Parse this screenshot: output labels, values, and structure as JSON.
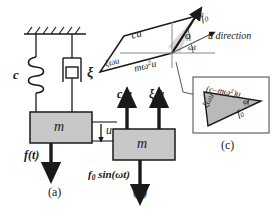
{
  "figure": {
    "background": "#ffffff",
    "ink_color": "#1a1a1a",
    "mass_fill": "#c8c8c8",
    "shade_fill": "#b5b5b5",
    "light_shade_fill": "#d9d9d9",
    "width": 273,
    "height": 217
  },
  "panel_a": {
    "tag": "(a)",
    "spring_label": "c",
    "damper_label": "ξ",
    "mass_label": "m",
    "displacement_label": "u",
    "force_label": "f(t)"
  },
  "panel_b": {
    "tag": "(b)",
    "mass_label": "m",
    "spring_force_label_main": "c",
    "spring_force_label_var": "u",
    "damper_force_label_main": "ξ",
    "damper_force_label_var": "u̇",
    "applied_force_label": "f",
    "applied_force_sub": "0",
    "applied_force_rest": " sin(ωt)"
  },
  "phasor": {
    "cu_label": "cu",
    "xi_omega_u_label": "ξωu",
    "m_omega2_u_label_pre": "mω",
    "m_omega2_u_label_sup": "2",
    "m_omega2_u_label_post": "u",
    "f0_label": "f",
    "f0_sub": "0",
    "phi_label": "φ",
    "omega_t_label": "ωt",
    "u_direction_label": "u direction"
  },
  "inset_c": {
    "tag": "(c)",
    "hypotenuse_label_pre": "(c–mω",
    "hypotenuse_label_sup": "2",
    "hypotenuse_label_post": ")u",
    "vertical_label": "ξωu",
    "resultant_label": "f",
    "resultant_sub": "0",
    "angle_label": "φ"
  }
}
